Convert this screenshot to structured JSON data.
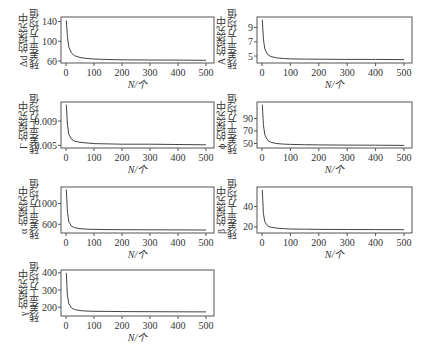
{
  "figure": {
    "x_axis_label": "N/个",
    "caption": ""
  },
  "chart_data": [
    {
      "type": "line",
      "id": "delta_d",
      "ylabel_line1": "Δd 的探究中",
      "ylabel_line2": "残差平方均值",
      "xlabel": "N/个",
      "xlim": [
        0,
        500
      ],
      "xticks": [
        0,
        100,
        200,
        300,
        400,
        500
      ],
      "ylim": [
        60,
        145
      ],
      "yticks": [
        60,
        100,
        140
      ],
      "x": [
        1,
        5,
        10,
        20,
        30,
        50,
        75,
        100,
        150,
        200,
        300,
        400,
        500
      ],
      "values": [
        142,
        110,
        88,
        76,
        71,
        67,
        65,
        64,
        63,
        62.5,
        62,
        61.8,
        61.5
      ]
    },
    {
      "type": "line",
      "id": "lambda",
      "ylabel_line1": "A 的探究中",
      "ylabel_line2": "残差平方均值",
      "xlabel": "N/个",
      "xlim": [
        0,
        500
      ],
      "xticks": [
        0,
        100,
        200,
        300,
        400,
        500
      ],
      "ylim": [
        4.3,
        10.2
      ],
      "yticks": [
        5,
        7,
        9
      ],
      "x": [
        1,
        5,
        10,
        20,
        30,
        50,
        75,
        100,
        150,
        200,
        300,
        400,
        500
      ],
      "values": [
        10.1,
        7.4,
        6.0,
        5.2,
        4.95,
        4.75,
        4.65,
        4.6,
        4.57,
        4.55,
        4.53,
        4.52,
        4.5
      ]
    },
    {
      "type": "line",
      "id": "gamma_upper",
      "ylabel_line1": "Γ 的探究中",
      "ylabel_line2": "残差平方均值",
      "xlabel": "N/个",
      "xlim": [
        0,
        500
      ],
      "xticks": [
        0,
        100,
        200,
        300,
        400,
        500
      ],
      "ylim": [
        0.0049,
        0.0118
      ],
      "yticks": [
        0.005,
        0.009
      ],
      "ytick_labels": [
        "0.005",
        "0.009"
      ],
      "x": [
        1,
        5,
        10,
        20,
        30,
        50,
        75,
        100,
        150,
        200,
        300,
        400,
        500
      ],
      "values": [
        0.0117,
        0.0085,
        0.0068,
        0.006,
        0.0057,
        0.0055,
        0.0054,
        0.0053,
        0.00525,
        0.0052,
        0.0052,
        0.00515,
        0.0051
      ]
    },
    {
      "type": "line",
      "id": "phi",
      "ylabel_line1": "ϕ 的探究中",
      "ylabel_line2": "残差平方均值",
      "xlabel": "N/个",
      "xlim": [
        0,
        500
      ],
      "xticks": [
        0,
        100,
        200,
        300,
        400,
        500
      ],
      "ylim": [
        46,
        113
      ],
      "yticks": [
        50,
        70,
        90
      ],
      "x": [
        1,
        5,
        10,
        20,
        30,
        50,
        75,
        100,
        150,
        200,
        300,
        400,
        500
      ],
      "values": [
        112,
        80,
        64,
        55,
        52,
        50,
        49,
        48.5,
        48,
        47.8,
        47.5,
        47.3,
        47
      ]
    },
    {
      "type": "line",
      "id": "alpha",
      "ylabel_line1": "α 的探究中",
      "ylabel_line2": "残差平方均值",
      "xlabel": "N/个",
      "xlim": [
        0,
        500
      ],
      "xticks": [
        0,
        100,
        200,
        300,
        400,
        500
      ],
      "ylim": [
        470,
        1280
      ],
      "yticks": [
        600,
        1000
      ],
      "x": [
        1,
        5,
        10,
        20,
        30,
        50,
        75,
        100,
        150,
        200,
        300,
        400,
        500
      ],
      "values": [
        1270,
        850,
        650,
        560,
        535,
        515,
        505,
        500,
        497,
        495,
        493,
        492,
        490
      ]
    },
    {
      "type": "line",
      "id": "beta",
      "ylabel_line1": "β 的探究中",
      "ylabel_line2": "残差平方均值",
      "xlabel": "N/个",
      "xlim": [
        0,
        500
      ],
      "xticks": [
        0,
        100,
        200,
        300,
        400,
        500
      ],
      "ylim": [
        16,
        57
      ],
      "yticks": [
        20,
        40
      ],
      "x": [
        1,
        5,
        10,
        20,
        30,
        50,
        75,
        100,
        150,
        200,
        300,
        400,
        500
      ],
      "values": [
        56,
        33,
        25,
        21,
        19.8,
        18.8,
        18.3,
        18,
        17.8,
        17.6,
        17.5,
        17.4,
        17.3
      ]
    },
    {
      "type": "line",
      "id": "gamma_lower",
      "ylabel_line1": "γ 的探究中",
      "ylabel_line2": "残差平方均值",
      "xlabel": "N/个",
      "xlim": [
        0,
        500
      ],
      "xticks": [
        0,
        100,
        200,
        300,
        400,
        500
      ],
      "ylim": [
        160,
        405
      ],
      "yticks": [
        200,
        300,
        400
      ],
      "x": [
        1,
        5,
        10,
        20,
        30,
        50,
        75,
        100,
        150,
        200,
        300,
        400,
        500
      ],
      "values": [
        400,
        270,
        220,
        195,
        186,
        180,
        177,
        176,
        175,
        174,
        173.5,
        173,
        172.5
      ]
    }
  ]
}
